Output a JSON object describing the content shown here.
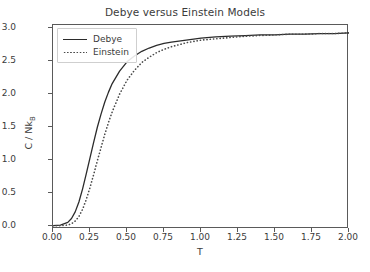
{
  "chart_data": {
    "type": "line",
    "title": "Debye versus Einstein Models",
    "xlabel": "T",
    "ylabel": "C / NkB",
    "ylabel_base": "C / Nk",
    "ylabel_sub": "B",
    "xlim": [
      0.0,
      2.0
    ],
    "ylim": [
      -0.05,
      3.05
    ],
    "grid": false,
    "legend_position": "upper left",
    "xticks": [
      "0.00",
      "0.25",
      "0.50",
      "0.75",
      "1.00",
      "1.25",
      "1.50",
      "1.75",
      "2.00"
    ],
    "xtick_values": [
      0.0,
      0.25,
      0.5,
      0.75,
      1.0,
      1.25,
      1.5,
      1.75,
      2.0
    ],
    "yticks": [
      "0.0",
      "0.5",
      "1.0",
      "1.5",
      "2.0",
      "2.5",
      "3.0"
    ],
    "ytick_values": [
      0.0,
      0.5,
      1.0,
      1.5,
      2.0,
      2.5,
      3.0
    ],
    "x": [
      0.0,
      0.05,
      0.1,
      0.125,
      0.15,
      0.175,
      0.2,
      0.225,
      0.25,
      0.275,
      0.3,
      0.325,
      0.35,
      0.375,
      0.4,
      0.45,
      0.5,
      0.55,
      0.6,
      0.65,
      0.7,
      0.75,
      0.8,
      0.9,
      1.0,
      1.1,
      1.2,
      1.3,
      1.4,
      1.5,
      1.6,
      1.7,
      1.8,
      1.9,
      2.0
    ],
    "series": [
      {
        "name": "Debye",
        "style": "solid",
        "color": "#2b2b2b",
        "values": [
          0.0,
          0.01,
          0.05,
          0.11,
          0.21,
          0.36,
          0.56,
          0.79,
          1.03,
          1.27,
          1.5,
          1.7,
          1.88,
          2.03,
          2.16,
          2.35,
          2.49,
          2.58,
          2.65,
          2.7,
          2.74,
          2.77,
          2.79,
          2.82,
          2.85,
          2.87,
          2.88,
          2.89,
          2.9,
          2.9,
          2.91,
          2.91,
          2.92,
          2.92,
          2.93
        ]
      },
      {
        "name": "Einstein",
        "style": "dotted",
        "color": "#4a4a4a",
        "values": [
          0.0,
          0.0,
          0.01,
          0.03,
          0.07,
          0.14,
          0.25,
          0.4,
          0.58,
          0.78,
          0.99,
          1.19,
          1.39,
          1.57,
          1.73,
          2.0,
          2.21,
          2.36,
          2.48,
          2.56,
          2.63,
          2.68,
          2.72,
          2.78,
          2.82,
          2.84,
          2.86,
          2.88,
          2.89,
          2.9,
          2.91,
          2.91,
          2.92,
          2.92,
          2.93
        ]
      }
    ]
  }
}
